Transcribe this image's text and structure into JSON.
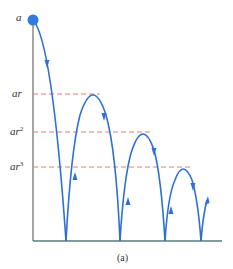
{
  "figure": {
    "caption": "(a)",
    "colors": {
      "curve": "#2f6fd6",
      "dot": "#2f7be0",
      "axis": "#888888",
      "ground": "#5a7a7a",
      "reference_line": "#e08070"
    },
    "labels": {
      "start": "a",
      "level1": "ar",
      "level2_base": "ar",
      "level2_exp": "2",
      "level3_base": "ar",
      "level3_exp": "3"
    },
    "levels": [
      {
        "name": "a",
        "y": 20
      },
      {
        "name": "ar",
        "y": 94
      },
      {
        "name": "ar^2",
        "y": 132
      },
      {
        "name": "ar^3",
        "y": 167
      }
    ],
    "bounce_points_x": [
      66,
      120,
      165,
      201
    ]
  }
}
